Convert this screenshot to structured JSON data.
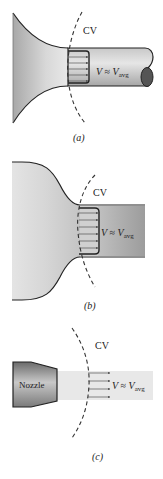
{
  "figures": [
    {
      "id": "a",
      "caption": "(a)",
      "cv_label": "CV",
      "velocity_label": {
        "main": "V",
        "approx": " ≈ ",
        "var": "V",
        "sub": "avg"
      }
    },
    {
      "id": "b",
      "caption": "(b)",
      "cv_label": "CV",
      "velocity_label": {
        "main": "V",
        "approx": " ≈ ",
        "var": "V",
        "sub": "avg"
      }
    },
    {
      "id": "c",
      "caption": "(c)",
      "cv_label": "CV",
      "nozzle_label": "Nozzle",
      "velocity_label": {
        "main": "V",
        "approx": " ≈ ",
        "var": "V",
        "sub": "avg"
      }
    }
  ],
  "colors": {
    "fill_light": "#e6e6e6",
    "fill_dark": "#9a9a9a",
    "outline": "#222222",
    "arrow": "#555555",
    "jet": "#e8e8e8"
  }
}
